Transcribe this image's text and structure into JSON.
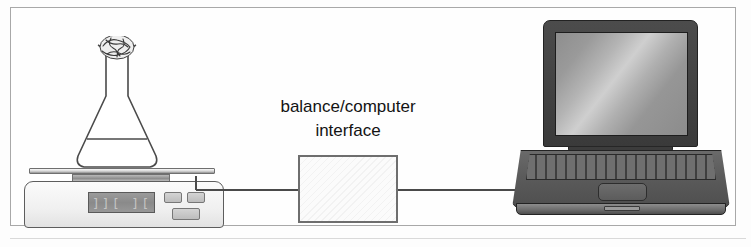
{
  "figure": {
    "background_color": "#fdfdfd",
    "border_color": "#a8a8a8"
  },
  "interface": {
    "label": "balance/computer\ninterface",
    "box_fill": "#fbfbfb",
    "box_border": "#6e6e6e"
  },
  "balance": {
    "name": "electronic balance",
    "display_value": "]][ ][",
    "display_color": "#8f8f8f",
    "body_color": "#f0f0f0",
    "buttons": [
      {
        "name": "balance-button-left"
      },
      {
        "name": "balance-button-right"
      },
      {
        "name": "balance-button-bottom"
      }
    ]
  },
  "flask": {
    "name": "erlenmeyer flask",
    "stopper": "cotton plug",
    "liquid_level_shown": true,
    "outline_color": "#4a4a4a"
  },
  "laptop": {
    "name": "laptop computer",
    "screen_color": "#b4b4b4",
    "bezel_color": "#3a3a3a",
    "body_color": "#5b5b5b"
  },
  "cable": {
    "name": "connecting cable",
    "color": "#4a4a4a"
  }
}
